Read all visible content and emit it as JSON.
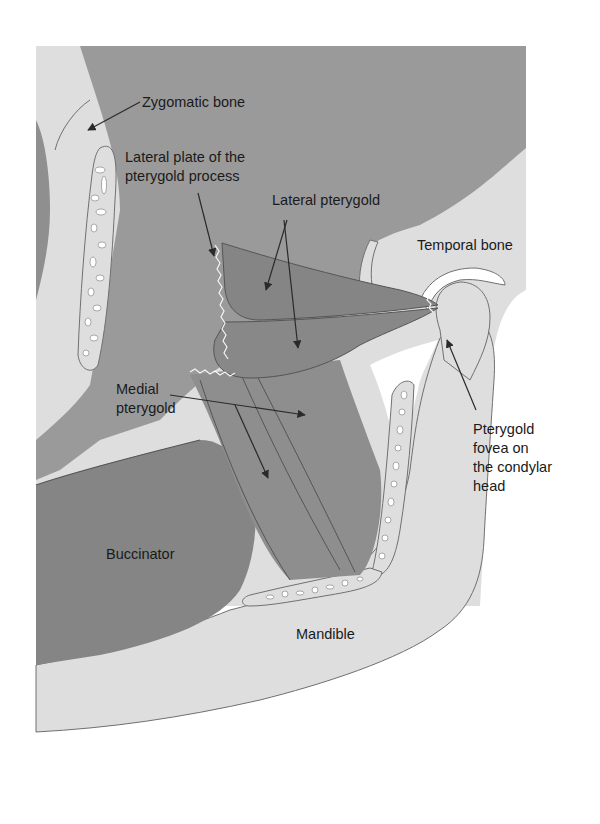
{
  "figure": {
    "type": "anatomical illustration",
    "colors": {
      "background": "#ffffff",
      "bone": "#dedede",
      "bone_outline": "#707070",
      "soft_tissue": "#9a9a9a",
      "muscle_dark": "#858585",
      "muscle_mid": "#8e8e8e",
      "marrow_spot": "#ffffff",
      "leader_line": "#2a2a2a",
      "text": "#1a1a1a"
    }
  },
  "labels": {
    "zygomatic_bone": "Zygomatic bone",
    "lateral_plate": "Lateral plate of the\npterygold process",
    "lateral_pterygold": "Lateral pterygold",
    "temporal_bone": "Temporal bone",
    "medial_pterygold": "Medial\npterygold",
    "pterygold_fovea": "Pterygold\nfovea on\nthe condylar\nhead",
    "buccinator": "Buccinator",
    "mandible": "Mandible"
  }
}
